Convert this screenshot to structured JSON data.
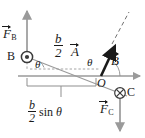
{
  "figure": {
    "colors": {
      "axis": "#9a9a9a",
      "construction": "#9a9a9a",
      "vector": "#1a1a1a",
      "force_arrow": "#9a9a9a",
      "background": "#ffffff",
      "text": "#1a1a1a"
    },
    "labels": {
      "force_b": {
        "symbol": "F",
        "subscript": "B",
        "vector": true
      },
      "force_c": {
        "symbol": "F",
        "subscript": "C",
        "vector": true
      },
      "point_b": "B",
      "point_c": "C",
      "origin": "O",
      "vector_a": {
        "symbol": "A",
        "vector": true
      },
      "vector_b_field": {
        "symbol": "B",
        "vector": true
      },
      "half_b_top": {
        "numerator": "b",
        "denominator": "2"
      },
      "half_b_sin": {
        "numerator": "b",
        "denominator": "2",
        "trailing": "sin",
        "angle": "θ"
      },
      "angle_at_b": "θ",
      "angle_at_o": "θ"
    },
    "markers": {
      "point_b_symbol": "dot-in-circle",
      "point_b_meaning": "current out of page",
      "point_c_symbol": "cross-in-circle",
      "point_c_meaning": "current into page"
    },
    "geometry": {
      "origin_px": [
        101,
        76
      ],
      "point_b_px": [
        27,
        57
      ],
      "point_c_px": [
        120,
        93
      ],
      "axis_right_end_px": [
        143,
        76
      ],
      "force_b_tip_px": [
        27,
        8
      ],
      "force_c_tip_px": [
        120,
        133
      ]
    }
  }
}
